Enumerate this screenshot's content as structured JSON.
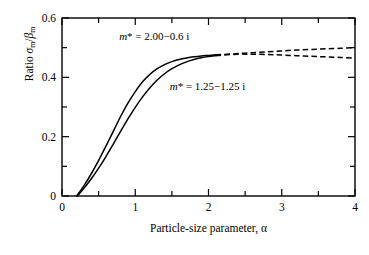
{
  "chart_data": {
    "type": "line",
    "title": "",
    "xlabel": "Particle-size parameter, α",
    "ylabel": "Ratio σm/βm",
    "xlim": [
      0,
      4
    ],
    "ylim": [
      0,
      0.6
    ],
    "grid": false,
    "legend_position": "inline-annotations",
    "x_major_ticks": [
      0,
      1,
      2,
      3,
      4
    ],
    "x_major_tick_labels": [
      "0",
      "1",
      "2",
      "3",
      "4"
    ],
    "x_minor_tick_step": 0.5,
    "y_major_ticks": [
      0,
      0.2,
      0.4,
      0.6
    ],
    "y_major_tick_labels": [
      "0",
      "0.2",
      "0.4",
      "0.6"
    ],
    "y_minor_tick_step": 0.1,
    "solid_dashed_split_x": 2.1,
    "series": [
      {
        "name": "m* = 2.00 − 0.6 i",
        "label_x": 0.78,
        "label_y": 0.535,
        "style": "solid-then-dashed",
        "x": [
          0.2,
          0.3,
          0.4,
          0.5,
          0.6,
          0.7,
          0.8,
          0.9,
          1.0,
          1.1,
          1.2,
          1.3,
          1.4,
          1.5,
          1.6,
          1.7,
          1.8,
          1.9,
          2.0,
          2.1,
          2.2,
          2.4,
          2.6,
          2.8,
          3.0,
          3.2,
          3.4,
          3.6,
          3.8,
          4.0
        ],
        "y": [
          0.0,
          0.035,
          0.075,
          0.12,
          0.168,
          0.218,
          0.268,
          0.313,
          0.352,
          0.385,
          0.41,
          0.429,
          0.443,
          0.453,
          0.46,
          0.465,
          0.469,
          0.472,
          0.474,
          0.476,
          0.477,
          0.48,
          0.483,
          0.486,
          0.489,
          0.492,
          0.494,
          0.496,
          0.498,
          0.5
        ]
      },
      {
        "name": "m* = 1.25 − 1.25 i",
        "label_x": 1.47,
        "label_y": 0.368,
        "style": "solid-then-dashed",
        "x": [
          0.21,
          0.3,
          0.4,
          0.5,
          0.6,
          0.7,
          0.8,
          0.9,
          1.0,
          1.1,
          1.2,
          1.3,
          1.4,
          1.5,
          1.6,
          1.7,
          1.8,
          1.9,
          2.0,
          2.1,
          2.2,
          2.4,
          2.6,
          2.8,
          3.0,
          3.2,
          3.4,
          3.6,
          3.8,
          4.0
        ],
        "y": [
          0.0,
          0.026,
          0.058,
          0.094,
          0.133,
          0.175,
          0.218,
          0.26,
          0.299,
          0.334,
          0.365,
          0.391,
          0.412,
          0.429,
          0.442,
          0.452,
          0.46,
          0.466,
          0.47,
          0.473,
          0.475,
          0.478,
          0.478,
          0.477,
          0.475,
          0.473,
          0.471,
          0.469,
          0.467,
          0.465
        ]
      }
    ]
  },
  "axis": {
    "x_title": "Particle-size parameter, α",
    "y_title_prefix": "Ratio ",
    "y_title_numerator": "σ",
    "y_title_num_sub": "m",
    "y_title_slash": "/",
    "y_title_denominator": "β",
    "y_title_den_sub": "m"
  },
  "annotations": [
    {
      "id": "ann-0",
      "m": "m",
      "star": "*",
      "eq": "= 2.00",
      "minus": "−",
      "imag": "0.6 i",
      "full_text": "m* = 2.00 − 0.6 i"
    },
    {
      "id": "ann-1",
      "m": "m",
      "star": "*",
      "eq": "= 1.25",
      "minus": "−",
      "imag": "1.25 i",
      "full_text": "m* = 1.25 − 1.25 i"
    }
  ],
  "colors": {
    "axis": "#000000",
    "curve": "#000000",
    "background": "#ffffff"
  }
}
